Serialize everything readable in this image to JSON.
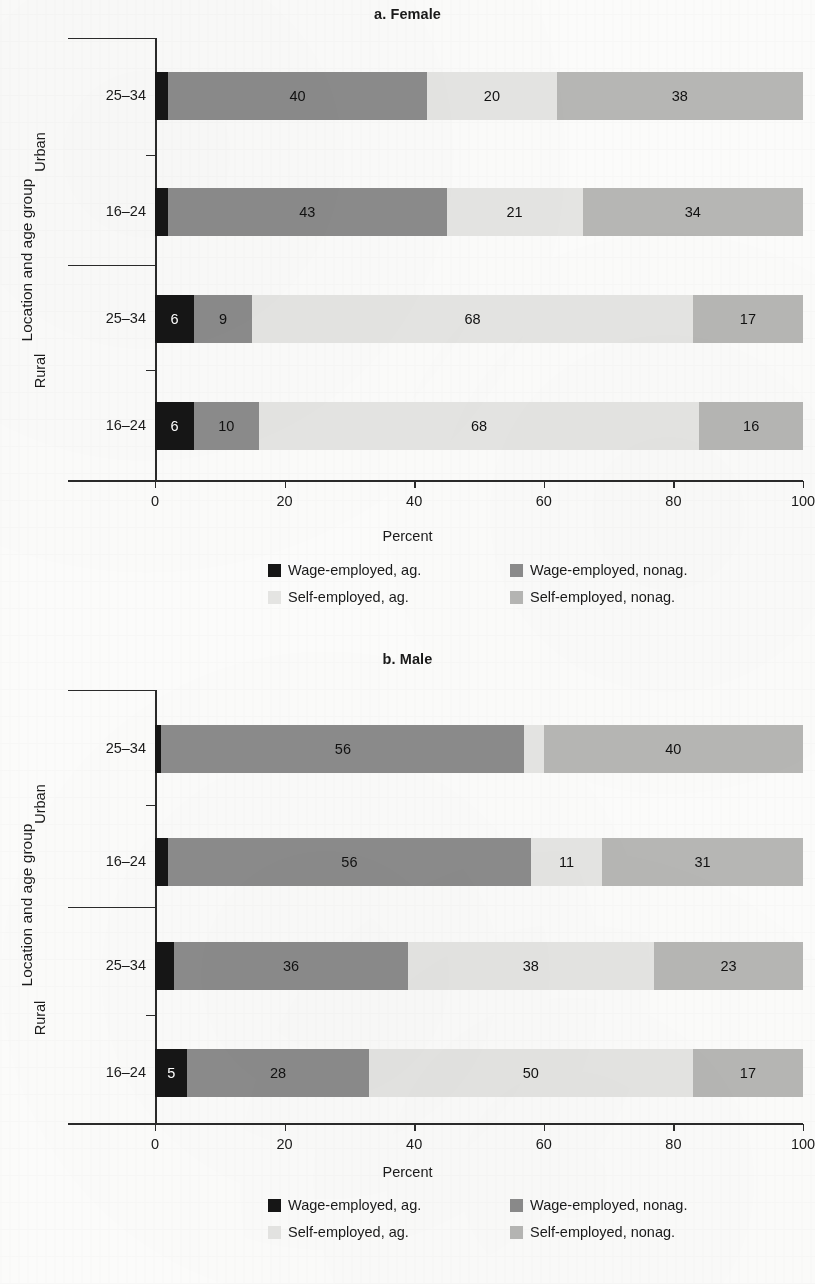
{
  "figure": {
    "y_axis_title": "Location and age group",
    "x_axis_title": "Percent",
    "x_ticks": [
      "0",
      "20",
      "40",
      "60",
      "80",
      "100"
    ],
    "group_labels": [
      "Urban",
      "Rural"
    ],
    "age_labels": [
      "25–34",
      "16–24"
    ]
  },
  "legend": {
    "items": [
      {
        "label": "Wage-employed, ag.",
        "color": "#161616"
      },
      {
        "label": "Wage-employed, nonag.",
        "color": "#8b8b8b"
      },
      {
        "label": "Self-employed, ag.",
        "color": "#e4e4e2"
      },
      {
        "label": "Self-employed, nonag.",
        "color": "#b6b6b4"
      }
    ]
  },
  "chart_data": [
    {
      "type": "bar",
      "orientation": "horizontal",
      "stacked": true,
      "title": "a. Female",
      "xlabel": "Percent",
      "ylabel": "Location and age group",
      "xlim": [
        0,
        100
      ],
      "xticks": [
        0,
        20,
        40,
        60,
        80,
        100
      ],
      "grid": false,
      "legend_position": "bottom",
      "categories": [
        "Urban 25–34",
        "Urban 16–24",
        "Rural 25–34",
        "Rural 16–24"
      ],
      "series": [
        {
          "name": "Wage-employed, ag.",
          "color": "#161616",
          "values": [
            2,
            2,
            6,
            6
          ]
        },
        {
          "name": "Wage-employed, nonag.",
          "color": "#8b8b8b",
          "values": [
            40,
            43,
            9,
            10
          ]
        },
        {
          "name": "Self-employed, ag.",
          "color": "#e4e4e2",
          "values": [
            20,
            21,
            68,
            68
          ]
        },
        {
          "name": "Self-employed, nonag.",
          "color": "#b6b6b4",
          "values": [
            38,
            34,
            17,
            16
          ]
        }
      ],
      "bar_labels": [
        [
          "",
          "40",
          "20",
          "38"
        ],
        [
          "",
          "43",
          "21",
          "34"
        ],
        [
          "6",
          "9",
          "68",
          "17"
        ],
        [
          "6",
          "10",
          "68",
          "16"
        ]
      ]
    },
    {
      "type": "bar",
      "orientation": "horizontal",
      "stacked": true,
      "title": "b. Male",
      "xlabel": "Percent",
      "ylabel": "Location and age group",
      "xlim": [
        0,
        100
      ],
      "xticks": [
        0,
        20,
        40,
        60,
        80,
        100
      ],
      "grid": false,
      "legend_position": "bottom",
      "categories": [
        "Urban 25–34",
        "Urban 16–24",
        "Rural 25–34",
        "Rural 16–24"
      ],
      "series": [
        {
          "name": "Wage-employed, ag.",
          "color": "#161616",
          "values": [
            1,
            2,
            3,
            5
          ]
        },
        {
          "name": "Wage-employed, nonag.",
          "color": "#8b8b8b",
          "values": [
            56,
            56,
            36,
            28
          ]
        },
        {
          "name": "Self-employed, ag.",
          "color": "#e4e4e2",
          "values": [
            3,
            11,
            38,
            50
          ]
        },
        {
          "name": "Self-employed, nonag.",
          "color": "#b6b6b4",
          "values": [
            40,
            31,
            23,
            17
          ]
        }
      ],
      "bar_labels": [
        [
          "",
          "56",
          "",
          "40"
        ],
        [
          "",
          "56",
          "11",
          "31"
        ],
        [
          "",
          "36",
          "38",
          "23"
        ],
        [
          "5",
          "28",
          "50",
          "17"
        ]
      ]
    }
  ]
}
